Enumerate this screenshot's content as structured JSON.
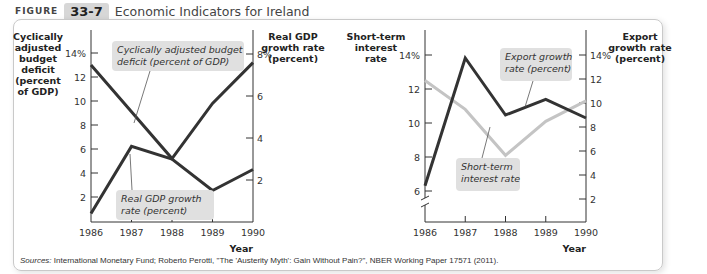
{
  "figure": {
    "label": "FIGURE",
    "number": "33-7",
    "title": "Economic Indicators for Ireland"
  },
  "sources": {
    "prefix": "Sources:",
    "text": " International Monetary Fund; Roberto Perotti, \"The 'Austerity Myth': Gain Without Pain?\", NBER Working Paper 17571 (2011)."
  },
  "colors": {
    "dark_line": "#333333",
    "light_line": "#c4c4c4",
    "callout_bg": "#e0e0e0"
  },
  "chart_data": [
    {
      "type": "line",
      "title": "",
      "categories": [
        "1986",
        "1987",
        "1988",
        "1989",
        "1990"
      ],
      "xlabel": "Year",
      "left_axis": {
        "label": [
          "Cyclically",
          "adjusted",
          "budget",
          "deficit",
          "(percent",
          "of GDP)"
        ],
        "ticks": [
          "2",
          "4",
          "6",
          "8",
          "10",
          "12",
          "14%"
        ],
        "ylim": [
          0,
          14
        ]
      },
      "right_axis": {
        "label": [
          "Real GDP",
          "growth rate",
          "(percent)"
        ],
        "ticks": [
          "2",
          "4",
          "6",
          "8%"
        ],
        "ylim": [
          0,
          8
        ]
      },
      "series": [
        {
          "name": "Cyclically adjusted budget deficit (percent of GDP)",
          "axis": "left",
          "values": [
            13.0,
            9.1,
            5.2,
            9.8,
            13.2
          ],
          "callout": [
            "Cyclically adjusted budget",
            "deficit (percent of GDP)"
          ]
        },
        {
          "name": "Real GDP growth rate (percent)",
          "axis": "right",
          "values": [
            0.4,
            3.6,
            3.0,
            1.5,
            2.5
          ],
          "callout": [
            "Real GDP growth",
            "rate (percent)"
          ]
        }
      ]
    },
    {
      "type": "line",
      "title": "",
      "categories": [
        "1986",
        "1987",
        "1988",
        "1989",
        "1990"
      ],
      "xlabel": "Year",
      "left_axis": {
        "label": [
          "Short-term",
          "interest",
          "rate"
        ],
        "ticks": [
          "6",
          "8",
          "10",
          "12",
          "14%"
        ],
        "ylim": [
          6,
          14
        ],
        "broken": true
      },
      "right_axis": {
        "label": [
          "Export",
          "growth rate",
          "(percent)"
        ],
        "ticks": [
          "2",
          "4",
          "6",
          "8",
          "10",
          "12",
          "14%"
        ],
        "ylim": [
          0,
          14
        ]
      },
      "series": [
        {
          "name": "Export growth rate (percent)",
          "axis": "right",
          "values": [
            3.1,
            13.75,
            9.0,
            10.3,
            8.75
          ],
          "callout": [
            "Export growth",
            "rate (percent)"
          ]
        },
        {
          "name": "Short-term interest rate",
          "axis": "left",
          "values": [
            12.5,
            10.8,
            8.1,
            10.1,
            11.3
          ],
          "callout": [
            "Short-term",
            "interest rate"
          ]
        }
      ]
    }
  ]
}
